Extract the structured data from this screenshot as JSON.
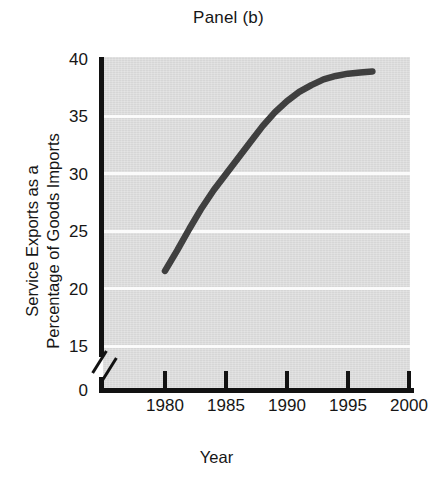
{
  "chart_data": {
    "type": "line",
    "title": "Panel (b)",
    "xlabel": "Year",
    "ylabel": "Service Exports as a Percentage of Goods Imports",
    "ylabel_lines": [
      "Service Exports as a",
      "Percentage of Goods Imports"
    ],
    "xlim": [
      1976.5,
      2000
    ],
    "ylim": [
      14.0,
      40.0
    ],
    "y_axis_break": true,
    "y_axis_break_below": 14.0,
    "grid": true,
    "grid_orientation": "horizontal",
    "legend": "none",
    "plot_background_color": "#d6d6d6",
    "gridline_color": "#fbfbfb",
    "line_color": "#3f3f3f",
    "axis_color": "#121212",
    "x_ticks": [
      1980,
      1985,
      1990,
      1995,
      2000
    ],
    "x_tick_labels": [
      "1980",
      "1985",
      "1990",
      "1995",
      "2000"
    ],
    "y_ticks": [
      0,
      15,
      20,
      25,
      30,
      35,
      40
    ],
    "y_tick_labels": [
      "0",
      "15",
      "20",
      "25",
      "30",
      "35",
      "40"
    ],
    "series": [
      {
        "name": "Service exports as a percentage of goods imports",
        "x": [
          1980,
          1981,
          1982,
          1983,
          1984,
          1985,
          1986,
          1987,
          1988,
          1989,
          1990,
          1991,
          1992,
          1993,
          1994,
          1995,
          1996,
          1997
        ],
        "values": [
          21.5,
          23.3,
          25.2,
          27.0,
          28.6,
          30.0,
          31.4,
          32.8,
          34.2,
          35.4,
          36.4,
          37.2,
          37.8,
          38.3,
          38.6,
          38.8,
          38.9,
          39.0
        ]
      }
    ]
  }
}
